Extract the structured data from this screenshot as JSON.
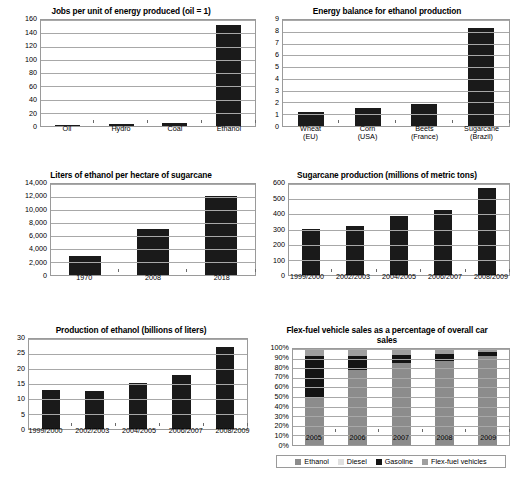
{
  "colors": {
    "bar": "#1a1a1a",
    "grid": "#a8a8a8",
    "frame": "#9a9a9a",
    "ethanol": "#8c8c8c",
    "diesel": "#e0e0e0",
    "gasoline": "#141414",
    "flexfuel": "#9f9f9f"
  },
  "chart_data": [
    {
      "id": "jobs-per-unit-energy",
      "type": "bar",
      "title": "Jobs per unit of energy produced (oil = 1)",
      "xlabel": "",
      "ylabel": "",
      "categories": [
        "Oil",
        "Hydro",
        "Coal",
        "Ethanol"
      ],
      "values": [
        1,
        3,
        4,
        152
      ],
      "ylim": [
        0,
        160
      ],
      "yticks": [
        0,
        20,
        40,
        60,
        80,
        100,
        120,
        140,
        160
      ],
      "yticklabels": [
        "0",
        "20",
        "40",
        "60",
        "80",
        "100",
        "120",
        "140",
        "160"
      ],
      "grid": true,
      "legend": false
    },
    {
      "id": "energy-balance-ethanol",
      "type": "bar",
      "title": "Energy balance for ethanol production",
      "xlabel": "",
      "ylabel": "",
      "categories": [
        "Wheat\n(EU)",
        "Corn\n(USA)",
        "Beets\n(France)",
        "Sugarcane\n(Brazil)"
      ],
      "values": [
        1.2,
        1.5,
        1.9,
        8.3
      ],
      "ylim": [
        0,
        9
      ],
      "yticks": [
        0,
        1,
        2,
        3,
        4,
        5,
        6,
        7,
        8,
        9
      ],
      "yticklabels": [
        "0",
        "1",
        "2",
        "3",
        "4",
        "5",
        "6",
        "7",
        "8",
        "9"
      ],
      "grid": true,
      "legend": false
    },
    {
      "id": "liters-per-hectare",
      "type": "bar",
      "title": "Liters of ethanol per hectare of sugarcane",
      "xlabel": "",
      "ylabel": "",
      "categories": [
        "1970",
        "2008",
        "2018"
      ],
      "values": [
        3000,
        7100,
        12100
      ],
      "ylim": [
        0,
        14000
      ],
      "yticks": [
        0,
        2000,
        4000,
        6000,
        8000,
        10000,
        12000,
        14000
      ],
      "yticklabels": [
        "0",
        "2,000",
        "4,000",
        "6,000",
        "8,000",
        "10,000",
        "12,000",
        "14,000"
      ],
      "grid": true,
      "legend": false
    },
    {
      "id": "sugarcane-production",
      "type": "bar",
      "title": "Sugarcane production (millions of metric tons)",
      "xlabel": "",
      "ylabel": "",
      "categories": [
        "1999/2000",
        "2002/2003",
        "2004/2005",
        "2006/2007",
        "2008/2009"
      ],
      "values": [
        305,
        320,
        390,
        428,
        572
      ],
      "ylim": [
        0,
        600
      ],
      "yticks": [
        0,
        100,
        200,
        300,
        400,
        500,
        600
      ],
      "yticklabels": [
        "0",
        "100",
        "200",
        "300",
        "400",
        "500",
        "600"
      ],
      "grid": true,
      "legend": false
    },
    {
      "id": "production-of-ethanol",
      "type": "bar",
      "title": "Production of ethanol (billions of liters)",
      "xlabel": "",
      "ylabel": "",
      "categories": [
        "1999/2000",
        "2002/2003",
        "2004/2005",
        "2006/2007",
        "2008/2009"
      ],
      "values": [
        13,
        12.8,
        15.5,
        18,
        27.2
      ],
      "ylim": [
        0,
        30
      ],
      "yticks": [
        0,
        5,
        10,
        15,
        20,
        25,
        30
      ],
      "yticklabels": [
        "0",
        "5",
        "10",
        "15",
        "20",
        "25",
        "30"
      ],
      "grid": true,
      "legend": false
    },
    {
      "id": "flex-fuel-share",
      "type": "bar",
      "subtype": "stacked-percent",
      "title": "Flex-fuel vehicle sales as a percentage of overall car sales",
      "xlabel": "",
      "ylabel": "",
      "categories": [
        "2005",
        "2006",
        "2007",
        "2008",
        "2009"
      ],
      "series": [
        {
          "name": "Ethanol",
          "color": "#8c8c8c",
          "values": [
            50,
            78,
            85,
            88,
            93
          ]
        },
        {
          "name": "Diesel",
          "color": "#e0e0e0",
          "values": [
            0,
            0,
            0,
            0,
            0
          ]
        },
        {
          "name": "Gasoline",
          "color": "#141414",
          "values": [
            43,
            15,
            9,
            7,
            4
          ]
        },
        {
          "name": "Flex-fuel vehicles",
          "color": "#9f9f9f",
          "values": [
            7,
            7,
            6,
            5,
            3
          ]
        }
      ],
      "ylim": [
        0,
        100
      ],
      "yticks": [
        0,
        10,
        20,
        30,
        40,
        50,
        60,
        70,
        80,
        90,
        100
      ],
      "yticklabels": [
        "0%",
        "10%",
        "20%",
        "30%",
        "40%",
        "50%",
        "60%",
        "70%",
        "80%",
        "90%",
        "100%"
      ],
      "grid": true,
      "legend": true,
      "legend_position": "bottom"
    }
  ]
}
